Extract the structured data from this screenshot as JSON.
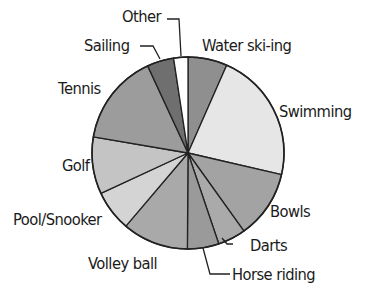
{
  "chart_data": {
    "type": "pie",
    "title": "",
    "start_angle_deg": 0,
    "direction": "clockwise",
    "center": [
      188,
      153
    ],
    "radius": 96,
    "legend": "none (direct labels with leader lines)",
    "slices": [
      {
        "label": "Water ski-ing",
        "value": 6.6,
        "color": "#8f8f8f"
      },
      {
        "label": "Swimming",
        "value": 22.0,
        "color": "#e6e6e6"
      },
      {
        "label": "Bowls",
        "value": 11.5,
        "color": "#a3a3a3"
      },
      {
        "label": "Darts",
        "value": 4.7,
        "color": "#aaaaaa"
      },
      {
        "label": "Horse riding",
        "value": 5.3,
        "color": "#9a9a9a"
      },
      {
        "label": "Volley ball",
        "value": 11.1,
        "color": "#a9a9a9"
      },
      {
        "label": "Pool/Snooker",
        "value": 6.9,
        "color": "#d4d4d4"
      },
      {
        "label": "Golf",
        "value": 9.6,
        "color": "#c4c4c4"
      },
      {
        "label": "Tennis",
        "value": 15.4,
        "color": "#9c9c9c"
      },
      {
        "label": "Sailing",
        "value": 4.5,
        "color": "#6f6f6f"
      },
      {
        "label": "Other",
        "value": 2.4,
        "color": "#ffffff"
      }
    ],
    "categories": [
      "Water ski-ing",
      "Swimming",
      "Bowls",
      "Darts",
      "Horse riding",
      "Volley ball",
      "Pool/Snooker",
      "Golf",
      "Tennis",
      "Sailing",
      "Other"
    ],
    "values": [
      6.6,
      22.0,
      11.5,
      4.7,
      5.3,
      11.1,
      6.9,
      9.6,
      15.4,
      4.5,
      2.4
    ]
  },
  "labels": [
    {
      "text": "Other",
      "x": 122,
      "y": 9
    },
    {
      "text": "Sailing",
      "x": 84,
      "y": 38
    },
    {
      "text": "Water ski-ing",
      "x": 202,
      "y": 38
    },
    {
      "text": "Tennis",
      "x": 58,
      "y": 81
    },
    {
      "text": "Swimming",
      "x": 279,
      "y": 104
    },
    {
      "text": "Golf",
      "x": 62,
      "y": 158
    },
    {
      "text": "Bowls",
      "x": 270,
      "y": 204
    },
    {
      "text": "Pool/Snooker",
      "x": 13,
      "y": 212
    },
    {
      "text": "Darts",
      "x": 250,
      "y": 238
    },
    {
      "text": "Volley ball",
      "x": 88,
      "y": 256
    },
    {
      "text": "Horse riding",
      "x": 232,
      "y": 267
    }
  ],
  "leader_lines": [
    "M 167 19 L 179 19 L 181 56",
    "M 140 46 L 153 46 L 160 59",
    "M 233 244 L 227 244 L 222 238",
    "M 230 274 L 210 274 L 203 248"
  ]
}
